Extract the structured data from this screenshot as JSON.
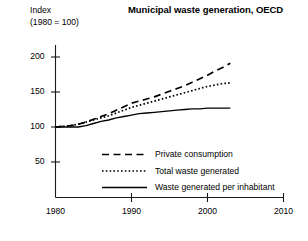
{
  "chart_data": {
    "type": "line",
    "title": "Municipal waste generation, OECD",
    "ylabel_line1": "Index",
    "ylabel_line2": "(1980 = 100)",
    "xlabel": "",
    "xlim": [
      1980,
      2010
    ],
    "ylim": [
      25,
      212
    ],
    "grid": false,
    "legend_position": "inside-lower-right",
    "xticks": [
      1980,
      1990,
      2000,
      2010
    ],
    "xtick_labels": [
      "1980",
      "1990",
      "2000",
      "2010"
    ],
    "yticks": [
      50,
      100,
      150,
      200
    ],
    "ytick_labels": [
      "50",
      "100",
      "150",
      "200"
    ],
    "series": [
      {
        "name": "Private consumption",
        "style": "dashed",
        "color": "#000000",
        "x": [
          1980,
          1981,
          1982,
          1983,
          1984,
          1985,
          1986,
          1987,
          1988,
          1989,
          1990,
          1991,
          1992,
          1993,
          1994,
          1995,
          1996,
          1997,
          1998,
          1999,
          2000,
          2001,
          2002,
          2003
        ],
        "values": [
          100,
          101,
          102,
          104,
          107,
          111,
          115,
          119,
          124,
          129,
          134,
          137,
          140,
          143,
          147,
          151,
          155,
          159,
          164,
          169,
          174,
          180,
          185,
          191
        ]
      },
      {
        "name": "Total waste generated",
        "style": "dotted",
        "color": "#000000",
        "x": [
          1980,
          1981,
          1982,
          1983,
          1984,
          1985,
          1986,
          1987,
          1988,
          1989,
          1990,
          1991,
          1992,
          1993,
          1994,
          1995,
          1996,
          1997,
          1998,
          1999,
          2000,
          2001,
          2002,
          2003
        ],
        "values": [
          100,
          101,
          102,
          104,
          107,
          110,
          113,
          116,
          120,
          124,
          128,
          131,
          134,
          137,
          140,
          143,
          146,
          149,
          152,
          155,
          158,
          160,
          162,
          163
        ]
      },
      {
        "name": "Waste generated per inhabitant",
        "style": "solid",
        "color": "#000000",
        "x": [
          1980,
          1981,
          1982,
          1983,
          1984,
          1985,
          1986,
          1987,
          1988,
          1989,
          1990,
          1991,
          1992,
          1993,
          1994,
          1995,
          1996,
          1997,
          1998,
          1999,
          2000,
          2001,
          2002,
          2003
        ],
        "values": [
          100,
          100,
          100,
          100,
          102,
          105,
          108,
          110,
          113,
          115,
          117,
          119,
          120,
          121,
          122,
          123,
          124,
          125,
          126,
          126,
          127,
          127,
          127,
          127
        ]
      }
    ]
  },
  "legend": {
    "items": [
      {
        "label": "Private consumption",
        "style": "dashed"
      },
      {
        "label": "Total waste generated",
        "style": "dotted"
      },
      {
        "label": "Waste generated per inhabitant",
        "style": "solid"
      }
    ]
  }
}
